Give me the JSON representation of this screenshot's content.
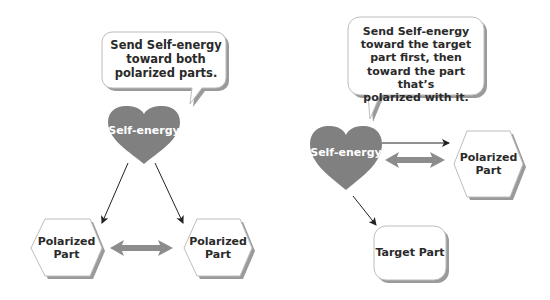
{
  "colors": {
    "heart_fill": "#808080",
    "arrow_gray": "#8c8c8c",
    "shape_stroke": "#bdbdbd",
    "shadow": "#9a9a9a",
    "text": "#2a2a2a",
    "heart_text": "#ffffff"
  },
  "left_diagram": {
    "bubble": {
      "lines": [
        "Send Self-energy",
        "toward both",
        "polarized parts."
      ]
    },
    "heart": {
      "label": "Self-energy"
    },
    "left_part": {
      "lines": [
        "Polarized",
        "Part"
      ]
    },
    "right_part": {
      "lines": [
        "Polarized",
        "Part"
      ]
    }
  },
  "right_diagram": {
    "bubble": {
      "lines": [
        "Send Self-energy",
        "toward the target",
        "part first, then",
        "toward the part that’s",
        "polarized with it."
      ]
    },
    "heart": {
      "label": "Self-energy"
    },
    "polarized_part": {
      "lines": [
        "Polarized",
        "Part"
      ]
    },
    "target_part": {
      "label": "Target Part"
    }
  }
}
